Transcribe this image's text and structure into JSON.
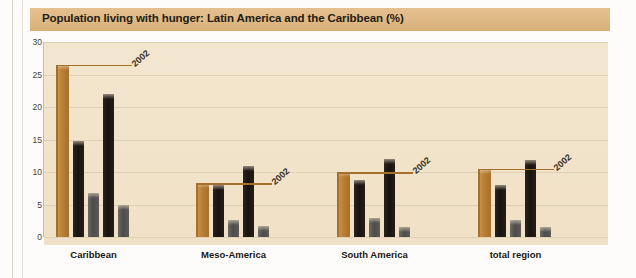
{
  "title": "Population living with hunger: Latin America and the Caribbean (%)",
  "colors": {
    "title_bar": "#dfba86",
    "plot_background": "#f2e4cb",
    "tan_bar": "#b87f36",
    "black_bar": "#191310",
    "grey_bar": "#4e4c4a",
    "gridline": "#ded0b4",
    "page_background": "#fdfcfa"
  },
  "chart_data": {
    "type": "bar",
    "title": "Population living with hunger: Latin America and the Caribbean (%)",
    "xlabel": "",
    "ylabel": "",
    "ylim": [
      0,
      30
    ],
    "yticks": [
      0,
      5,
      10,
      15,
      20,
      25,
      30
    ],
    "grid": true,
    "legend": "none",
    "categories": [
      "Caribbean",
      "Meso-America",
      "South America",
      "total region"
    ],
    "series": [
      {
        "name": "tan",
        "color": "#b87f36",
        "values": [
          26.5,
          8.3,
          10.0,
          10.5
        ]
      },
      {
        "name": "black-1",
        "color": "#191310",
        "values": [
          14.8,
          8.0,
          8.8,
          8.0
        ]
      },
      {
        "name": "grey-1",
        "color": "#4e4c4a",
        "values": [
          6.7,
          2.6,
          2.9,
          2.6
        ]
      },
      {
        "name": "black-2",
        "color": "#191310",
        "values": [
          22.0,
          11.0,
          12.0,
          11.8
        ]
      },
      {
        "name": "grey-2",
        "color": "#4e4c4a",
        "values": [
          5.0,
          1.7,
          1.5,
          1.6
        ]
      }
    ],
    "annotations": [
      {
        "text": "2002",
        "category": "Caribbean"
      },
      {
        "text": "2002",
        "category": "Meso-America"
      },
      {
        "text": "2002",
        "category": "South America"
      },
      {
        "text": "2002",
        "category": "total region"
      }
    ]
  }
}
